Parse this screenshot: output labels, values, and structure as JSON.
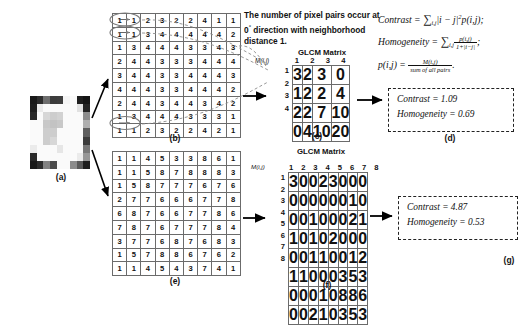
{
  "figure": {
    "note": "The number of pixel pairs occur at 0° direction with neighborhood distance 1.",
    "note_line1": "The number of pixel pairs",
    "note_line2": "occur at 0",
    "note_deg": "°",
    "note_line2b": "direction with",
    "note_line3": "neighborhood distance 1."
  },
  "panels": {
    "a": {
      "caption": "(a)",
      "label": "original-image-patch"
    },
    "b": {
      "caption": "(b)",
      "label": "gray-level-matrix-low-contrast"
    },
    "c": {
      "caption": "(c)",
      "title": "GLCM Matrix",
      "axis_label": "M(i,j)"
    },
    "d": {
      "caption": "(d)"
    },
    "e": {
      "caption": "(e)",
      "label": "gray-level-matrix-high-contrast"
    },
    "f": {
      "caption": "(f)",
      "title": "GLCM Matrix",
      "axis_label": "M(i,j)"
    },
    "g": {
      "caption": "(g)"
    }
  },
  "formulas": {
    "contrast_name": "Contrast",
    "contrast_sum": "∑",
    "contrast_sub": "i,j",
    "contrast_body": "|i − j|",
    "contrast_pow": "2",
    "contrast_tail": "p(i,j);",
    "homogeneity_name": "Homogeneity",
    "homogeneity_num": "p(i,j)",
    "homogeneity_den": "1+|i−j|",
    "homogeneity_tail": ";",
    "p_name": "p(i,j) =",
    "p_num": "M(i,j)",
    "p_den": "sum of all pairs",
    "p_tail": "."
  },
  "results": {
    "d": {
      "contrast_label": "Contrast",
      "contrast_value": "1.09",
      "homogeneity_label": "Homogeneity",
      "homogeneity_value": "0.69",
      "eq": "="
    },
    "g": {
      "contrast_label": "Contrast",
      "contrast_value": "4.87",
      "homogeneity_label": "Homogeneity",
      "homogeneity_value": "0.53",
      "eq": "="
    }
  },
  "matrix_b": {
    "rows": [
      [
        1,
        1,
        2,
        3,
        2,
        2,
        4,
        1,
        1
      ],
      [
        1,
        1,
        3,
        4,
        4,
        4,
        4,
        4,
        2
      ],
      [
        1,
        3,
        4,
        4,
        4,
        3,
        3,
        4,
        3
      ],
      [
        2,
        4,
        4,
        3,
        3,
        3,
        4,
        4,
        4
      ],
      [
        3,
        4,
        4,
        3,
        3,
        4,
        4,
        4,
        3
      ],
      [
        4,
        4,
        4,
        3,
        3,
        4,
        4,
        4,
        2
      ],
      [
        2,
        4,
        4,
        3,
        4,
        4,
        3,
        4,
        2
      ],
      [
        1,
        3,
        4,
        4,
        4,
        3,
        3,
        3,
        1
      ],
      [
        1,
        1,
        2,
        3,
        2,
        2,
        4,
        2,
        1
      ]
    ]
  },
  "matrix_e": {
    "rows": [
      [
        1,
        1,
        4,
        5,
        3,
        3,
        8,
        6,
        1
      ],
      [
        1,
        1,
        5,
        8,
        7,
        8,
        8,
        8,
        3
      ],
      [
        1,
        5,
        8,
        7,
        7,
        7,
        6,
        7,
        6
      ],
      [
        2,
        7,
        7,
        6,
        6,
        6,
        7,
        7,
        8
      ],
      [
        6,
        8,
        7,
        6,
        6,
        7,
        7,
        8,
        6
      ],
      [
        7,
        8,
        7,
        6,
        7,
        7,
        7,
        8,
        4
      ],
      [
        3,
        7,
        7,
        6,
        8,
        7,
        6,
        8,
        3
      ],
      [
        1,
        5,
        7,
        8,
        8,
        6,
        7,
        6,
        2
      ],
      [
        1,
        1,
        4,
        5,
        4,
        3,
        7,
        4,
        1
      ]
    ]
  },
  "glcm_c": {
    "col_headers": [
      1,
      2,
      3,
      4
    ],
    "row_headers": [
      1,
      2,
      3,
      4
    ],
    "rows": [
      [
        3,
        2,
        3,
        0
      ],
      [
        1,
        2,
        2,
        4
      ],
      [
        2,
        2,
        7,
        10
      ],
      [
        0,
        4,
        10,
        20
      ]
    ]
  },
  "glcm_f": {
    "col_headers": [
      1,
      2,
      3,
      4,
      5,
      6,
      7,
      8
    ],
    "row_headers": [
      1,
      2,
      3,
      4,
      5,
      6,
      7,
      8
    ],
    "rows": [
      [
        3,
        0,
        0,
        2,
        3,
        0,
        0,
        0
      ],
      [
        0,
        0,
        0,
        0,
        0,
        0,
        1,
        0
      ],
      [
        0,
        0,
        1,
        0,
        0,
        0,
        2,
        1
      ],
      [
        1,
        0,
        1,
        0,
        2,
        0,
        0,
        0
      ],
      [
        0,
        0,
        1,
        1,
        0,
        0,
        1,
        2
      ],
      [
        1,
        1,
        0,
        0,
        0,
        3,
        5,
        3
      ],
      [
        0,
        0,
        0,
        1,
        0,
        8,
        8,
        6
      ],
      [
        0,
        0,
        2,
        1,
        0,
        3,
        5,
        3
      ]
    ]
  },
  "image_a": {
    "pixels": [
      [
        25,
        45,
        110,
        60,
        62,
        245,
        250,
        30,
        20
      ],
      [
        30,
        235,
        250,
        250,
        250,
        250,
        250,
        225,
        35
      ],
      [
        40,
        250,
        215,
        205,
        210,
        250,
        250,
        250,
        140
      ],
      [
        250,
        250,
        200,
        195,
        200,
        250,
        250,
        250,
        175
      ],
      [
        250,
        250,
        205,
        205,
        250,
        250,
        250,
        250,
        95
      ],
      [
        250,
        250,
        205,
        215,
        250,
        250,
        250,
        250,
        60
      ],
      [
        235,
        250,
        250,
        250,
        230,
        250,
        250,
        250,
        120
      ],
      [
        40,
        250,
        250,
        250,
        250,
        250,
        250,
        235,
        150
      ],
      [
        25,
        45,
        130,
        75,
        250,
        250,
        140,
        90,
        30
      ]
    ]
  },
  "colors": {
    "grid_line": "#6b6b6b",
    "text": "#111111",
    "box_border": "#222222",
    "arrow": "#000000",
    "dashed_curve": "#8c8c8c",
    "ellipse": "#7a7a7a"
  }
}
